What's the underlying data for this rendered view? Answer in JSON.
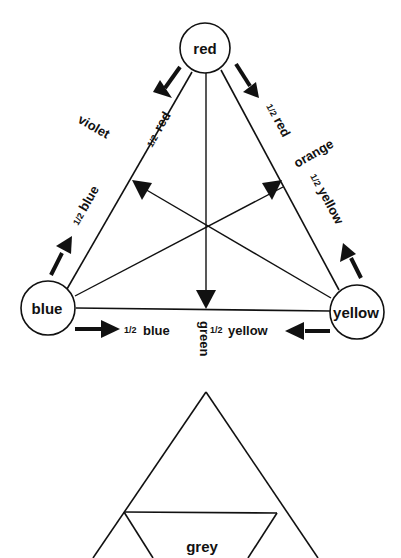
{
  "diagram": {
    "title": "",
    "colors": {
      "ink": "#111111",
      "background": "#ffffff"
    },
    "nodes": [
      {
        "id": "red",
        "label": "red"
      },
      {
        "id": "blue",
        "label": "blue"
      },
      {
        "id": "yellow",
        "label": "yellow"
      }
    ],
    "edges": [
      {
        "from": "red",
        "to": "blue",
        "mix_label": "violet",
        "labels": [
          "½ red",
          "½ blue"
        ]
      },
      {
        "from": "red",
        "to": "yellow",
        "mix_label": "orange",
        "labels": [
          "½ red",
          "½ yellow"
        ]
      },
      {
        "from": "blue",
        "to": "yellow",
        "mix_label": "green",
        "labels": [
          "½ blue",
          "½ yellow"
        ]
      }
    ],
    "edge_labels": {
      "half_red_left": "red",
      "violet": "violet",
      "half_blue_left": "blue",
      "half_red_right": "red",
      "orange": "orange",
      "half_yellow_right": "yellow",
      "half_blue_bottom": "blue",
      "half_yellow_bottom": "yellow",
      "green": "green",
      "fraction": "1/2"
    },
    "lower_figure": {
      "center_label": "grey"
    }
  }
}
